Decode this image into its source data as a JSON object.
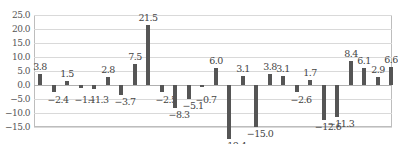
{
  "chart_data": {
    "type": "bar",
    "title": "",
    "xlabel": "",
    "ylabel": "",
    "ylim": [
      -15.0,
      25.0
    ],
    "yticks": [
      "25.0",
      "20.0",
      "15.0",
      "10.0",
      "5.0",
      "0.0",
      "-5.0",
      "-10.0",
      "-15.0"
    ],
    "grid": true,
    "legend": null,
    "bar_color": "#555555",
    "categories": [
      "1",
      "2",
      "3",
      "4",
      "5",
      "6",
      "7",
      "8",
      "9",
      "10",
      "11",
      "12",
      "13",
      "14",
      "15",
      "16",
      "17",
      "18",
      "19",
      "20",
      "21",
      "22",
      "23",
      "24",
      "25",
      "26",
      "27"
    ],
    "values": [
      3.8,
      -2.4,
      1.5,
      -1.1,
      -1.3,
      2.8,
      -3.7,
      7.5,
      21.5,
      -2.5,
      -8.3,
      -5.1,
      -0.7,
      6.0,
      -19.4,
      3.1,
      -15.0,
      3.8,
      3.1,
      -2.6,
      1.7,
      -12.6,
      -11.3,
      8.4,
      6.1,
      2.9,
      6.6
    ],
    "labels": [
      "3.8",
      "−2.4",
      "1.5",
      "−1.1",
      "−1.3",
      "2.8",
      "−3.7",
      "7.5",
      "21.5",
      "−2.5",
      "−8.3",
      "−5.1",
      "−0.7",
      "6.0",
      "−19.4",
      "3.1",
      "−15.0",
      "3.8",
      "3.1",
      "−2.6",
      "1.7",
      "−12.6",
      "−11.3",
      "8.4",
      "6.1",
      "2.9",
      "6.6"
    ]
  }
}
